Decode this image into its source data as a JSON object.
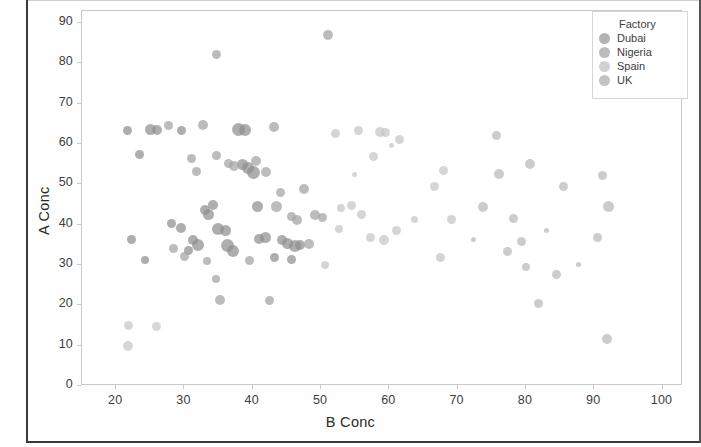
{
  "chart_data": {
    "type": "scatter",
    "title": "",
    "xlabel": "B Conc",
    "ylabel": "A Conc",
    "xlim": [
      15,
      103
    ],
    "ylim": [
      0,
      93
    ],
    "xticks": [
      "20",
      "30",
      "40",
      "50",
      "60",
      "70",
      "80",
      "90",
      "100"
    ],
    "yticks": [
      "0",
      "10",
      "20",
      "30",
      "40",
      "50",
      "60",
      "70",
      "80",
      "90"
    ],
    "grid": false,
    "legend": {
      "title": "Factory",
      "position": "top-right",
      "entries": [
        {
          "label": "Dubai",
          "color": "#9a9a9a"
        },
        {
          "label": "Nigeria",
          "color": "#a6a6a6"
        },
        {
          "label": "Spain",
          "color": "#c2c2c2"
        },
        {
          "label": "UK",
          "color": "#b0b0b0"
        }
      ]
    },
    "note": "Grayscale scan; marker size varies (bubble encoding). Series assignment approximated by marker darkness.",
    "series": [
      {
        "name": "Dubai",
        "color": "#8f8f8f",
        "points": [
          {
            "x": 21.8,
            "y": 63.2,
            "s": 9
          },
          {
            "x": 23.6,
            "y": 57.2,
            "s": 9
          },
          {
            "x": 25.2,
            "y": 63.3,
            "s": 11
          },
          {
            "x": 26.2,
            "y": 63.3,
            "s": 10
          },
          {
            "x": 24.4,
            "y": 30.9,
            "s": 8
          },
          {
            "x": 22.4,
            "y": 36.1,
            "s": 9
          },
          {
            "x": 29.7,
            "y": 63.2,
            "s": 9
          },
          {
            "x": 28.3,
            "y": 40.1,
            "s": 9
          },
          {
            "x": 29.6,
            "y": 39.0,
            "s": 10
          },
          {
            "x": 30.8,
            "y": 33.4,
            "s": 9
          },
          {
            "x": 31.4,
            "y": 36.0,
            "s": 10
          },
          {
            "x": 32.2,
            "y": 34.6,
            "s": 12
          },
          {
            "x": 33.2,
            "y": 43.3,
            "s": 10
          },
          {
            "x": 33.6,
            "y": 42.2,
            "s": 11
          },
          {
            "x": 34.4,
            "y": 44.7,
            "s": 10
          },
          {
            "x": 35.1,
            "y": 38.6,
            "s": 12
          },
          {
            "x": 36.1,
            "y": 38.4,
            "s": 11
          },
          {
            "x": 36.4,
            "y": 34.5,
            "s": 13
          },
          {
            "x": 37.2,
            "y": 33.2,
            "s": 12
          },
          {
            "x": 38.1,
            "y": 63.4,
            "s": 13
          },
          {
            "x": 39.0,
            "y": 63.2,
            "s": 12
          },
          {
            "x": 38.6,
            "y": 54.8,
            "s": 11
          },
          {
            "x": 39.4,
            "y": 53.9,
            "s": 12
          },
          {
            "x": 40.2,
            "y": 52.6,
            "s": 13
          },
          {
            "x": 40.8,
            "y": 44.2,
            "s": 11
          },
          {
            "x": 41.1,
            "y": 36.2,
            "s": 10
          },
          {
            "x": 42.0,
            "y": 36.5,
            "s": 11
          },
          {
            "x": 44.4,
            "y": 36.0,
            "s": 10
          },
          {
            "x": 45.2,
            "y": 35.2,
            "s": 11
          },
          {
            "x": 46.4,
            "y": 34.4,
            "s": 12
          },
          {
            "x": 47.1,
            "y": 34.6,
            "s": 10
          },
          {
            "x": 43.3,
            "y": 31.7,
            "s": 9
          },
          {
            "x": 45.8,
            "y": 31.2,
            "s": 9
          }
        ]
      },
      {
        "name": "Nigeria",
        "color": "#a3a3a3",
        "points": [
          {
            "x": 27.8,
            "y": 64.4,
            "s": 9
          },
          {
            "x": 32.9,
            "y": 64.4,
            "s": 10
          },
          {
            "x": 34.8,
            "y": 81.9,
            "s": 9
          },
          {
            "x": 31.2,
            "y": 56.1,
            "s": 9
          },
          {
            "x": 31.9,
            "y": 52.9,
            "s": 9
          },
          {
            "x": 34.9,
            "y": 57.0,
            "s": 9
          },
          {
            "x": 36.6,
            "y": 55.0,
            "s": 9
          },
          {
            "x": 37.4,
            "y": 54.2,
            "s": 10
          },
          {
            "x": 40.6,
            "y": 55.5,
            "s": 10
          },
          {
            "x": 42.1,
            "y": 52.8,
            "s": 10
          },
          {
            "x": 43.3,
            "y": 64.0,
            "s": 10
          },
          {
            "x": 44.2,
            "y": 47.8,
            "s": 9
          },
          {
            "x": 43.6,
            "y": 44.2,
            "s": 11
          },
          {
            "x": 45.8,
            "y": 41.7,
            "s": 9
          },
          {
            "x": 46.6,
            "y": 41.0,
            "s": 10
          },
          {
            "x": 47.6,
            "y": 48.7,
            "s": 10
          },
          {
            "x": 49.3,
            "y": 42.2,
            "s": 10
          },
          {
            "x": 50.3,
            "y": 41.5,
            "s": 9
          },
          {
            "x": 48.4,
            "y": 35.0,
            "s": 10
          },
          {
            "x": 33.4,
            "y": 30.8,
            "s": 8
          },
          {
            "x": 34.7,
            "y": 26.2,
            "s": 8
          },
          {
            "x": 35.3,
            "y": 21.1,
            "s": 10
          },
          {
            "x": 42.6,
            "y": 20.9,
            "s": 9
          },
          {
            "x": 28.5,
            "y": 33.8,
            "s": 9
          },
          {
            "x": 30.1,
            "y": 31.9,
            "s": 9
          },
          {
            "x": 39.6,
            "y": 30.9,
            "s": 9
          },
          {
            "x": 51.2,
            "y": 86.8,
            "s": 10
          }
        ]
      },
      {
        "name": "Spain",
        "color": "#c6c6c6",
        "points": [
          {
            "x": 52.2,
            "y": 62.3,
            "s": 9
          },
          {
            "x": 55.6,
            "y": 63.0,
            "s": 9
          },
          {
            "x": 58.8,
            "y": 62.8,
            "s": 10
          },
          {
            "x": 59.6,
            "y": 62.6,
            "s": 9
          },
          {
            "x": 61.6,
            "y": 60.9,
            "s": 9
          },
          {
            "x": 57.9,
            "y": 56.7,
            "s": 9
          },
          {
            "x": 54.6,
            "y": 44.6,
            "s": 9
          },
          {
            "x": 56.1,
            "y": 42.4,
            "s": 9
          },
          {
            "x": 57.4,
            "y": 36.6,
            "s": 9
          },
          {
            "x": 59.3,
            "y": 36.0,
            "s": 10
          },
          {
            "x": 61.2,
            "y": 38.2,
            "s": 9
          },
          {
            "x": 52.8,
            "y": 38.6,
            "s": 8
          },
          {
            "x": 50.8,
            "y": 29.7,
            "s": 8
          },
          {
            "x": 53.1,
            "y": 44.0,
            "s": 8
          },
          {
            "x": 63.8,
            "y": 41.0,
            "s": 7
          },
          {
            "x": 66.8,
            "y": 49.3,
            "s": 9
          },
          {
            "x": 68.1,
            "y": 53.3,
            "s": 9
          },
          {
            "x": 69.3,
            "y": 41.1,
            "s": 9
          },
          {
            "x": 67.6,
            "y": 31.5,
            "s": 9
          },
          {
            "x": 60.5,
            "y": 59.4,
            "s": 5
          },
          {
            "x": 55.0,
            "y": 52.3,
            "s": 5
          }
        ]
      },
      {
        "name": "UK",
        "color": "#b9b9b9",
        "points": [
          {
            "x": 73.8,
            "y": 44.2,
            "s": 10
          },
          {
            "x": 75.9,
            "y": 61.8,
            "s": 9
          },
          {
            "x": 76.2,
            "y": 52.3,
            "s": 10
          },
          {
            "x": 77.4,
            "y": 33.1,
            "s": 9
          },
          {
            "x": 78.4,
            "y": 41.2,
            "s": 9
          },
          {
            "x": 79.5,
            "y": 35.5,
            "s": 9
          },
          {
            "x": 80.1,
            "y": 29.2,
            "s": 8
          },
          {
            "x": 80.8,
            "y": 54.9,
            "s": 10
          },
          {
            "x": 82.0,
            "y": 20.3,
            "s": 9
          },
          {
            "x": 84.6,
            "y": 27.5,
            "s": 9
          },
          {
            "x": 85.7,
            "y": 49.3,
            "s": 9
          },
          {
            "x": 87.9,
            "y": 30.0,
            "s": 5
          },
          {
            "x": 90.6,
            "y": 36.5,
            "s": 9
          },
          {
            "x": 91.4,
            "y": 51.9,
            "s": 9
          },
          {
            "x": 92.3,
            "y": 44.2,
            "s": 11
          },
          {
            "x": 92.0,
            "y": 11.4,
            "s": 10
          },
          {
            "x": 72.5,
            "y": 36.1,
            "s": 5
          },
          {
            "x": 83.1,
            "y": 38.2,
            "s": 5
          }
        ]
      },
      {
        "name": "low-left",
        "color": "#c9c9c9",
        "points": [
          {
            "x": 22.0,
            "y": 14.8,
            "s": 9
          },
          {
            "x": 21.9,
            "y": 9.6,
            "s": 10
          },
          {
            "x": 26.1,
            "y": 14.6,
            "s": 9
          }
        ]
      }
    ]
  }
}
